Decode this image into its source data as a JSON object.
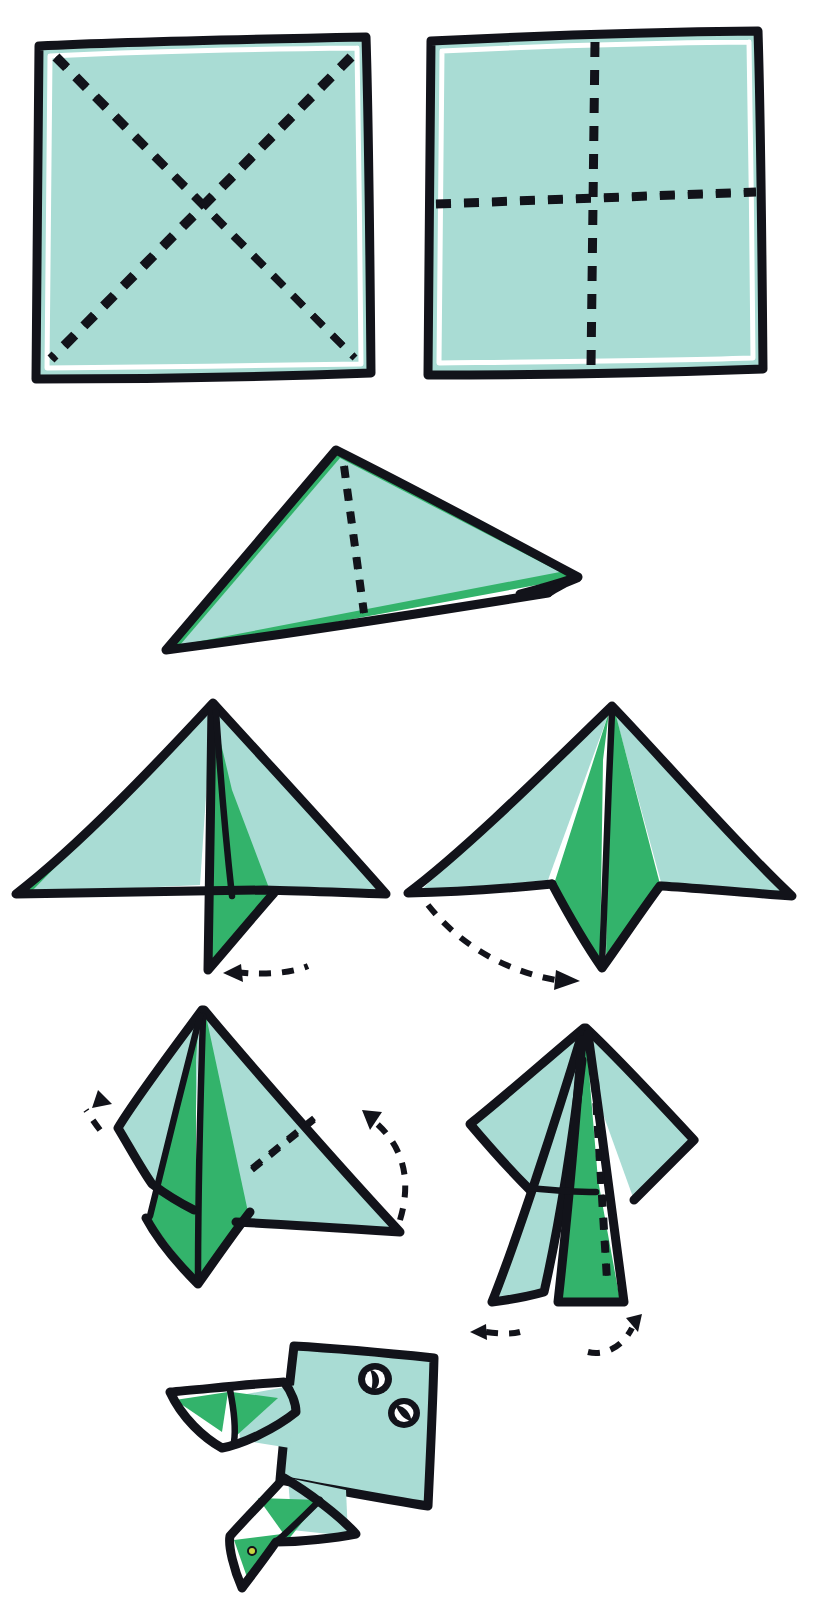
{
  "diagram": {
    "title": "Origami jumping frog folding instructions",
    "step_count": 8,
    "background_color": "#ffffff",
    "ink_color": "#12131a",
    "paper_front_color": "#a9dcd4",
    "paper_back_color": "#33b36b",
    "eye_white_color": "#ffffff"
  },
  "steps": [
    {
      "index": 1,
      "name": "square-diagonal-creases",
      "caption": "",
      "shape": "square",
      "creases": [
        "diagonal-top-left-to-bottom-right",
        "diagonal-top-right-to-bottom-left"
      ],
      "crease_style": "dashed",
      "arrows": []
    },
    {
      "index": 2,
      "name": "square-cross-creases",
      "caption": "",
      "shape": "square",
      "creases": [
        "vertical-center",
        "horizontal-center"
      ],
      "crease_style": "dashed",
      "arrows": []
    },
    {
      "index": 3,
      "name": "flattened-triangle",
      "caption": "",
      "shape": "triangle",
      "creases": [
        "vertical-center"
      ],
      "crease_style": "dashed",
      "arrows": []
    },
    {
      "index": 4,
      "name": "one-flap-folded-down",
      "caption": "",
      "shape": "arrow-form-left",
      "creases": [],
      "arrows": [
        "dashed-arrow-pointing-left-below"
      ]
    },
    {
      "index": 5,
      "name": "both-flaps-folded-down",
      "caption": "",
      "shape": "arrow-form-symmetric",
      "creases": [],
      "arrows": [
        "dashed-arrow-curving-right-to-center"
      ]
    },
    {
      "index": 6,
      "name": "side-points-folded-up",
      "caption": "",
      "shape": "kite-form-tilted",
      "creases": [
        "diagonal-right-wing"
      ],
      "arrows": [
        "dashed-arrow-up-left-on-left-side",
        "dashed-arrow-up-left-on-right-side"
      ]
    },
    {
      "index": 7,
      "name": "narrowed-legs-form",
      "caption": "",
      "shape": "tall-legs-form",
      "creases": [
        "vertical-center"
      ],
      "arrows": [
        "dashed-arrow-pointing-left-below",
        "dashed-arrow-curving-up-right-below"
      ]
    },
    {
      "index": 8,
      "name": "finished-frog",
      "caption": "",
      "shape": "frog",
      "creases": [],
      "arrows": [],
      "features": [
        "body",
        "front-leg",
        "back-leg",
        "eye-upper",
        "eye-lower"
      ]
    }
  ],
  "frog": {
    "eyes": [
      {
        "name": "eye-upper",
        "pupil": "diagonal-slit"
      },
      {
        "name": "eye-lower",
        "pupil": "diagonal-slit"
      }
    ],
    "legs": [
      "front-leg",
      "back-leg"
    ]
  }
}
